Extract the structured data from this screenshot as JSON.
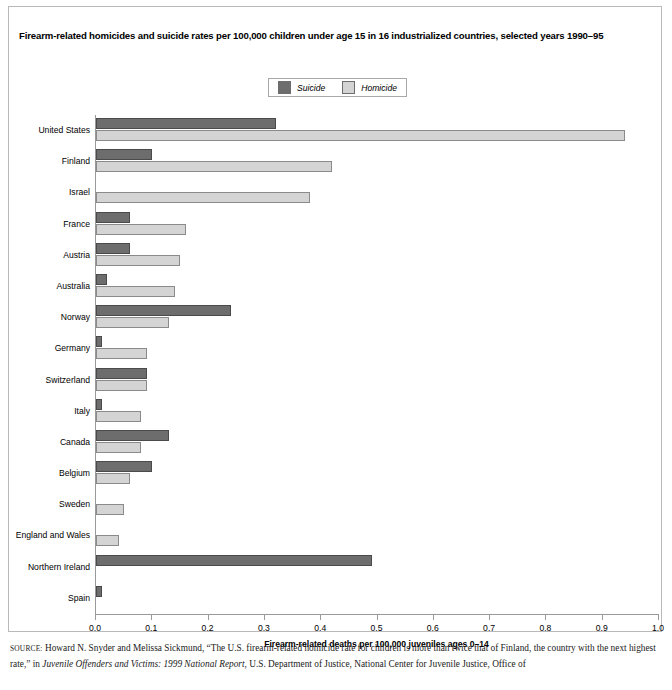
{
  "title": "Firearm-related homicides and suicide rates per 100,000 children under age 15 in 16 industrialized countries, selected years 1990–95",
  "legend": {
    "items": [
      {
        "label": "Suicide",
        "color": "#6d6d6d",
        "name": "suicide"
      },
      {
        "label": "Homicide",
        "color": "#d4d4d4",
        "name": "homicide"
      }
    ]
  },
  "source": {
    "prefix": "SOURCE:",
    "line1": " Howard N. Snyder and Melissa Sickmund, “The U.S. firearm-related homicide rate for children is more than twice that of Finland, the country with",
    "line2a": "the next highest rate,” in ",
    "line2b": "Juvenile Offenders and Victims: 1999 National Report",
    "line2c": ", U.S. Department of Justice, National Center for Juvenile Justice, Office of"
  },
  "chart_data": {
    "type": "bar",
    "orientation": "horizontal",
    "title": "Firearm-related homicides and suicide rates per 100,000 children under age 15 in 16 industrialized countries, selected years 1990–95",
    "xlabel": "Firearm-related deaths per 100,000 juveniles ages 0–14",
    "ylabel": "",
    "xlim": [
      0.0,
      1.0
    ],
    "xticks": [
      "0.0",
      "0.1",
      "0.2",
      "0.3",
      "0.4",
      "0.5",
      "0.6",
      "0.7",
      "0.8",
      "0.9",
      "1.0"
    ],
    "xtick_values": [
      0.0,
      0.1,
      0.2,
      0.3,
      0.4,
      0.5,
      0.6,
      0.7,
      0.8,
      0.9,
      1.0
    ],
    "grid": false,
    "legend_position": "top-center",
    "categories": [
      "United States",
      "Finland",
      "Israel",
      "France",
      "Austria",
      "Australia",
      "Norway",
      "Germany",
      "Switzerland",
      "Italy",
      "Canada",
      "Belgium",
      "Sweden",
      "England and Wales",
      "Northern Ireland",
      "Spain"
    ],
    "series": [
      {
        "name": "Suicide",
        "color": "#6d6d6d",
        "values": [
          0.32,
          0.1,
          0.0,
          0.06,
          0.06,
          0.02,
          0.24,
          0.01,
          0.09,
          0.01,
          0.13,
          0.1,
          0.0,
          0.0,
          0.49,
          0.01
        ]
      },
      {
        "name": "Homicide",
        "color": "#d4d4d4",
        "values": [
          0.94,
          0.42,
          0.38,
          0.16,
          0.15,
          0.14,
          0.13,
          0.09,
          0.09,
          0.08,
          0.08,
          0.06,
          0.05,
          0.04,
          0.0,
          0.0
        ]
      }
    ]
  }
}
